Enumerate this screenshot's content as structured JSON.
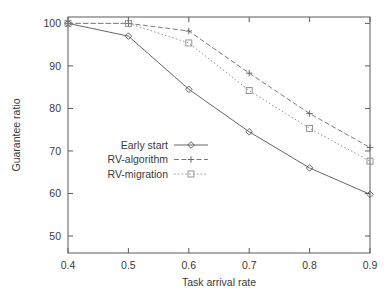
{
  "chart_data": {
    "type": "line",
    "title": "",
    "xlabel": "Task arrival rate",
    "ylabel": "Guarantee ratio",
    "x": [
      0.4,
      0.5,
      0.6,
      0.7,
      0.8,
      0.9
    ],
    "xtick_labels": [
      "0.4",
      "0.5",
      "0.6",
      "0.7",
      "0.8",
      "0.9"
    ],
    "ytick_labels": [
      "50",
      "60",
      "70",
      "80",
      "90",
      "100"
    ],
    "yticks": [
      50,
      60,
      70,
      80,
      90,
      100
    ],
    "xlim": [
      0.4,
      0.9
    ],
    "ylim": [
      46,
      101.5
    ],
    "grid": false,
    "legend_position": "center-left",
    "series": [
      {
        "name": "Early start",
        "values": [
          100,
          97.0,
          84.5,
          74.5,
          66.0,
          59.8
        ],
        "marker": "diamond",
        "dash": "solid",
        "color": "#555555"
      },
      {
        "name": "RV-algorithm",
        "values": [
          100,
          100,
          98.2,
          88.3,
          78.8,
          70.8
        ],
        "marker": "plus",
        "dash": "dashed",
        "color": "#6a6a6a"
      },
      {
        "name": "RV-migration",
        "values": [
          100,
          100,
          95.4,
          84.2,
          75.3,
          67.6
        ],
        "marker": "square",
        "dash": "dotted",
        "color": "#8a8a8a"
      }
    ]
  },
  "legend": {
    "items": [
      {
        "label": "Early start"
      },
      {
        "label": "RV-algorithm"
      },
      {
        "label": "RV-migration"
      }
    ]
  },
  "axes": {
    "x_title": "Task arrival rate",
    "y_title": "Guarantee ratio"
  }
}
